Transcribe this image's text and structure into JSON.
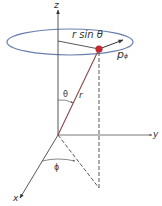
{
  "diagram": {
    "axes": {
      "z_label": "z",
      "y_label": "y",
      "x_label": "x"
    },
    "labels": {
      "r_sin_theta": "r sin θ",
      "p_phi_main": "p",
      "p_phi_sub": "ϕ",
      "theta": "θ",
      "r": "r",
      "phi": "ϕ"
    },
    "colors": {
      "ellipse": "#6a7fb0",
      "particle": "#c0282d",
      "lines": "#555555",
      "radius_vector": "#8a4a4a",
      "text": "#333333"
    }
  }
}
